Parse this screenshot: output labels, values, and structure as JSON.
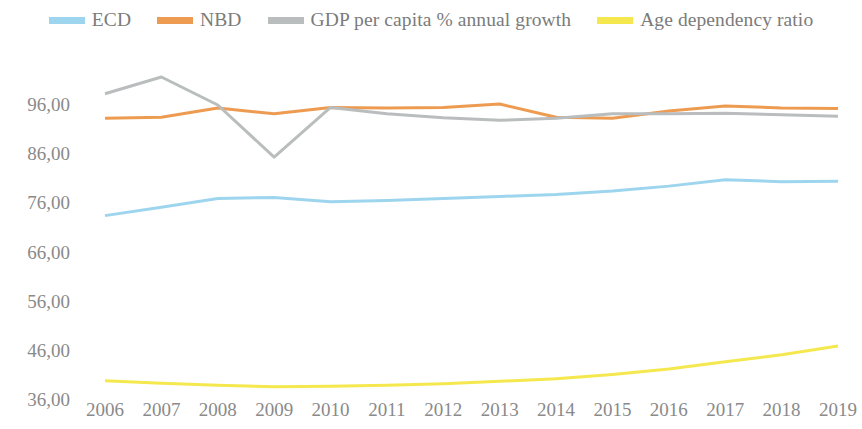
{
  "chart_data": {
    "type": "line",
    "title": "",
    "subtitle": "",
    "xlabel": "",
    "ylabel": "",
    "grid": false,
    "legend_position": "top",
    "categories": [
      "2006",
      "2007",
      "2008",
      "2009",
      "2010",
      "2011",
      "2012",
      "2013",
      "2014",
      "2015",
      "2016",
      "2017",
      "2018",
      "2019"
    ],
    "x": [
      2006,
      2007,
      2008,
      2009,
      2010,
      2011,
      2012,
      2013,
      2014,
      2015,
      2016,
      2017,
      2018,
      2019
    ],
    "ylim": [
      36.0,
      101.7
    ],
    "yticks": [
      36.0,
      46.0,
      56.0,
      66.0,
      76.0,
      86.0,
      96.0
    ],
    "ytick_labels": [
      "36,00",
      "46,00",
      "56,00",
      "66,00",
      "76,00",
      "86,00",
      "96,00"
    ],
    "series": [
      {
        "name": "ECD",
        "color": "#9ED5EE",
        "values": [
          73.5,
          75.2,
          77.0,
          77.2,
          76.3,
          76.6,
          77.0,
          77.4,
          77.8,
          78.5,
          79.5,
          80.8,
          80.4,
          80.5
        ]
      },
      {
        "name": "NBD",
        "color": "#ED9B51",
        "values": [
          93.3,
          93.5,
          95.4,
          94.2,
          95.5,
          95.4,
          95.5,
          96.2,
          93.5,
          93.3,
          94.8,
          95.8,
          95.4,
          95.3
        ]
      },
      {
        "name": "GDP per capita % annual growth",
        "color": "#B9BDBE",
        "values": [
          98.3,
          101.7,
          96.0,
          85.4,
          95.5,
          94.2,
          93.4,
          92.9,
          93.3,
          94.2,
          94.2,
          94.3,
          94.0,
          93.7
        ]
      },
      {
        "name": "Age dependency ratio",
        "color": "#F5E84E",
        "values": [
          39.9,
          39.4,
          39.0,
          38.7,
          38.8,
          39.0,
          39.3,
          39.8,
          40.3,
          41.2,
          42.3,
          43.8,
          45.2,
          47.0
        ]
      }
    ]
  },
  "legend": {
    "items": [
      {
        "label": "ECD",
        "color": "#9ED5EE"
      },
      {
        "label": "NBD",
        "color": "#ED9B51"
      },
      {
        "label": "GDP per capita % annual growth",
        "color": "#B9BDBE"
      },
      {
        "label": "Age dependency ratio",
        "color": "#F5E84E"
      }
    ]
  }
}
